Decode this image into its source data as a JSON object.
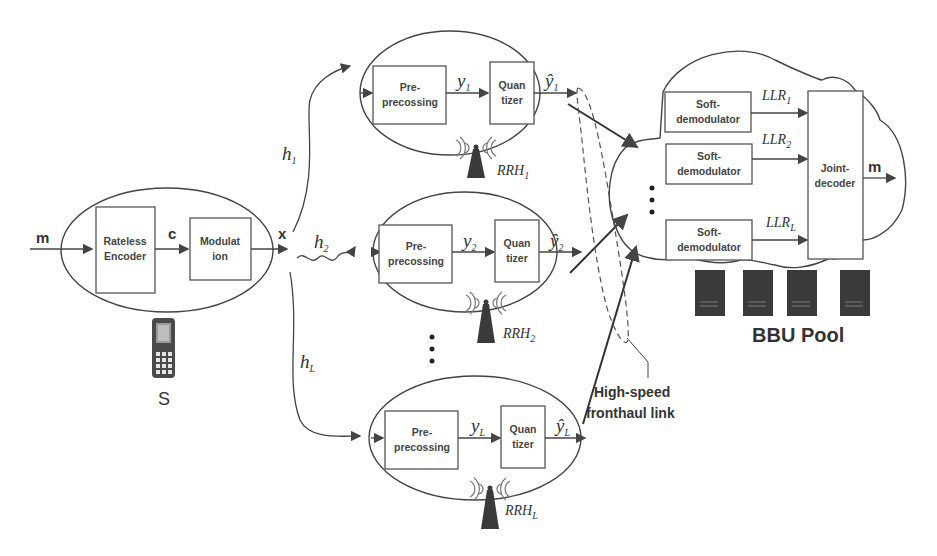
{
  "source": {
    "label": "S",
    "input_symbol": "m",
    "coded_symbol": "c",
    "output_symbol": "x",
    "encoder": {
      "line1": "Rateless",
      "line2": "Encoder"
    },
    "modulator": {
      "line1": "Modulat",
      "line2": "ion"
    }
  },
  "channels": [
    {
      "name": "h",
      "sub": "1"
    },
    {
      "name": "h",
      "sub": "2"
    },
    {
      "name": "h",
      "sub": "L"
    }
  ],
  "rrhs": [
    {
      "label": "RRH",
      "sub": "1",
      "pre": {
        "line1": "Pre-",
        "line2": "precossing"
      },
      "y": "y",
      "y_sub": "1",
      "quant": {
        "line1": "Quan",
        "line2": "tizer"
      },
      "yhat": "ŷ",
      "yhat_sub": "1"
    },
    {
      "label": "RRH",
      "sub": "2",
      "pre": {
        "line1": "Pre-",
        "line2": "precossing"
      },
      "y": "y",
      "y_sub": "2",
      "quant": {
        "line1": "Quan",
        "line2": "tizer"
      },
      "yhat": "ŷ",
      "yhat_sub": "2"
    },
    {
      "label": "RRH",
      "sub": "L",
      "pre": {
        "line1": "Pre-",
        "line2": "precossing"
      },
      "y": "y",
      "y_sub": "L",
      "quant": {
        "line1": "Quan",
        "line2": "tizer"
      },
      "yhat": "ŷ",
      "yhat_sub": "L"
    }
  ],
  "fronthaul": {
    "line1": "High-speed",
    "line2": "fronthaul link"
  },
  "bbu": {
    "label": "BBU Pool",
    "demods": [
      {
        "line1": "Soft-",
        "line2": "demodulator",
        "llr": "LLR",
        "llr_sub": "1"
      },
      {
        "line1": "Soft-",
        "line2": "demodulator",
        "llr": "LLR",
        "llr_sub": "2"
      },
      {
        "line1": "Soft-",
        "line2": "demodulator",
        "llr": "LLR",
        "llr_sub": "L"
      }
    ],
    "decoder": {
      "line1": "Joint-",
      "line2": "decoder"
    },
    "output_symbol": "m"
  },
  "ellipsis": "⋮"
}
